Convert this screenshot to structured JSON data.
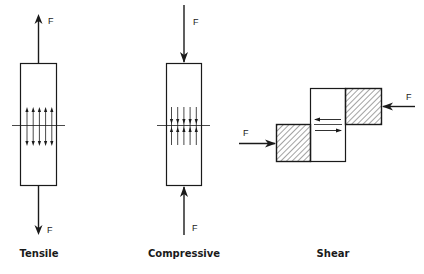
{
  "diagram": {
    "force_label": "F",
    "panels": [
      {
        "id": "tensile",
        "label": "Tensile",
        "force_direction": "outward",
        "internal_arrows": 5
      },
      {
        "id": "compressive",
        "label": "Compressive",
        "force_direction": "inward",
        "internal_arrows": 5
      },
      {
        "id": "shear",
        "label": "Shear",
        "force_direction": "opposing-horizontal",
        "internal_arrows": 2
      }
    ],
    "colors": {
      "stroke": "#1a1a1a",
      "background": "#ffffff"
    }
  }
}
